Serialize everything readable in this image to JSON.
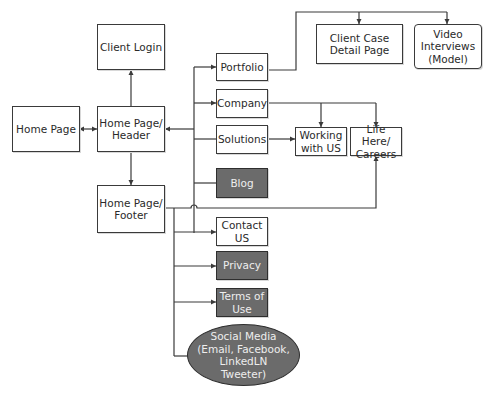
{
  "diagram": {
    "type": "sitemap-flowchart",
    "nodes": {
      "home_page": {
        "label": "Home Page",
        "style": "white"
      },
      "client_login": {
        "label": "Client Login",
        "style": "white"
      },
      "header": {
        "label": "Home Page/\nHeader",
        "style": "white"
      },
      "footer": {
        "label": "Home Page/\nFooter",
        "style": "white"
      },
      "portfolio": {
        "label": "Portfolio",
        "style": "white"
      },
      "company": {
        "label": "Company",
        "style": "white"
      },
      "solutions": {
        "label": "Solutions",
        "style": "white"
      },
      "blog": {
        "label": "Blog",
        "style": "dark"
      },
      "contact": {
        "label": "Contact\nUS",
        "style": "white"
      },
      "privacy": {
        "label": "Privacy",
        "style": "dark"
      },
      "terms": {
        "label": "Terms of\nUse",
        "style": "dark"
      },
      "social": {
        "label": "Social Media\n(Email, Facebook,\nLinkedLN\nTweeter)",
        "style": "dark-ellipse"
      },
      "client_case": {
        "label": "Client Case\nDetail Page",
        "style": "white"
      },
      "video": {
        "label": "Video\nInterviews\n(Model)",
        "style": "white-rounded"
      },
      "working": {
        "label": "Working\nwith US",
        "style": "white"
      },
      "careers": {
        "label": "Life Here/\nCareers",
        "style": "white"
      }
    },
    "edges": [
      {
        "from": "home_page",
        "to": "header",
        "bidirectional": true
      },
      {
        "from": "header",
        "to": "client_login"
      },
      {
        "from": "header",
        "to": "footer"
      },
      {
        "from": "portfolio",
        "to": "header"
      },
      {
        "from": "header",
        "to": "portfolio"
      },
      {
        "from": "header",
        "to": "company"
      },
      {
        "from": "header",
        "to": "solutions"
      },
      {
        "from": "header",
        "to": "blog"
      },
      {
        "from": "portfolio",
        "to": "client_case"
      },
      {
        "from": "portfolio",
        "to": "video"
      },
      {
        "from": "company",
        "to": "working"
      },
      {
        "from": "company",
        "to": "careers"
      },
      {
        "from": "solutions",
        "to": "working"
      },
      {
        "from": "footer",
        "to": "careers"
      },
      {
        "from": "footer",
        "to": "contact"
      },
      {
        "from": "footer",
        "to": "privacy"
      },
      {
        "from": "footer",
        "to": "terms"
      },
      {
        "from": "footer",
        "to": "social"
      }
    ],
    "colors": {
      "line": "#3a3a3a",
      "dark_fill": "#6b6b6b",
      "dark_text": "#eeeeee",
      "light_fill": "#ffffff"
    }
  }
}
